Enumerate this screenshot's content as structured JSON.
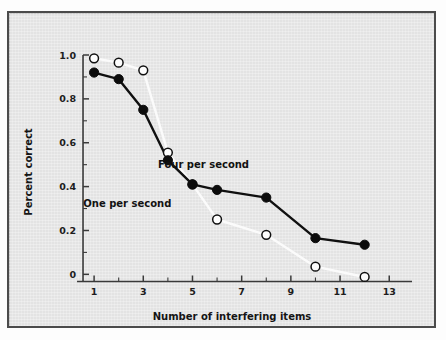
{
  "chart_data": {
    "type": "line",
    "title": "",
    "xlabel": "Number of interfering items",
    "ylabel": "Percent correct",
    "xlim": [
      0,
      13.6
    ],
    "ylim": [
      -0.06,
      1.0
    ],
    "grid": false,
    "legend_position": "inline-annotations",
    "x_ticks_major": [
      1,
      3,
      5,
      7,
      9,
      11,
      13
    ],
    "x_tick_labels": [
      "1",
      "3",
      "5",
      "7",
      "9",
      "11",
      "13"
    ],
    "x_ticks_minor": [
      2,
      4,
      6,
      8,
      10,
      12
    ],
    "y_ticks_major": [
      0,
      0.2,
      0.4,
      0.6,
      0.8,
      1.0
    ],
    "y_tick_labels": [
      "0",
      "0.2",
      "0.4",
      "0.6",
      "0.8",
      "1.0"
    ],
    "y_ticks_minor": [
      0.1,
      0.3,
      0.5,
      0.7,
      0.9
    ],
    "series": [
      {
        "name": "Four per second",
        "marker": "filled-circle",
        "color": "#0c0c0c",
        "line_color": "#101010",
        "x": [
          1,
          2,
          3,
          4,
          5,
          6,
          8,
          10,
          12
        ],
        "values": [
          0.92,
          0.89,
          0.75,
          0.52,
          0.41,
          0.385,
          0.35,
          0.165,
          0.135
        ]
      },
      {
        "name": "One per second",
        "marker": "open-circle",
        "color": "#fdfdfd",
        "line_color": "#fbfbfb",
        "x": [
          1,
          2,
          3,
          4,
          5,
          6,
          8,
          10,
          12
        ],
        "values": [
          0.985,
          0.965,
          0.93,
          0.555,
          0.41,
          0.25,
          0.18,
          0.035,
          -0.012
        ]
      }
    ],
    "annotations": [
      {
        "text": "Four per second",
        "x": 5.45,
        "y": 0.485
      },
      {
        "text": "One per second",
        "x": 2.35,
        "y": 0.305
      }
    ]
  }
}
